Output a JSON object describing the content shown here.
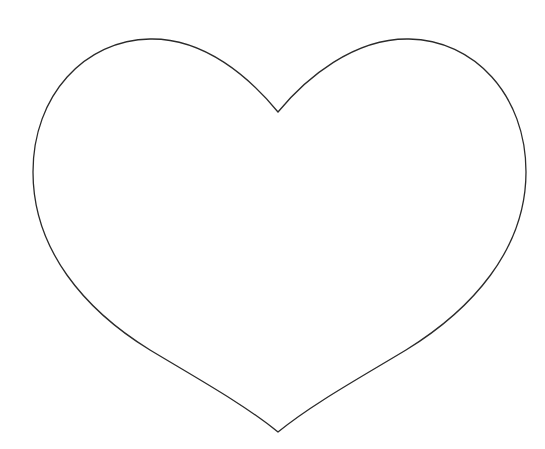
{
  "image": {
    "width": 545,
    "height": 449,
    "background": "#ffffff"
  },
  "heart": {
    "shape": "heart-outline",
    "stroke_color": "#2b2b2b",
    "fill_color": "#ffffff",
    "stroke_width": 1.3,
    "path": "M278,112 C250,78 205,38 150,39 C85,40 33,95 33,172 C33,250 85,310 150,350 C200,380 245,405 278,432 C311,405 356,380 406,350 C471,310 526,250 526,172 C526,95 474,40 409,39 C354,38 306,78 278,112 Z"
  }
}
